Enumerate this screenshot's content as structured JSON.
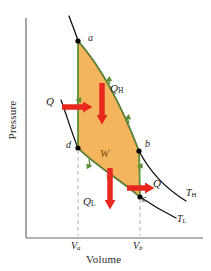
{
  "figure": {
    "type": "carnot-cycle-pv-diagram",
    "axes": {
      "x_title": "Volume",
      "y_title": "Pressure",
      "x_ticks": [
        {
          "id": "Va",
          "base": "V",
          "sub": "a",
          "x": 78
        },
        {
          "id": "Vb",
          "base": "V",
          "sub": "b",
          "x": 139
        }
      ]
    },
    "state_points": [
      {
        "id": "a",
        "label": "a",
        "x": 78,
        "y": 41
      },
      {
        "id": "b",
        "label": "b",
        "x": 139,
        "y": 151
      },
      {
        "id": "c",
        "label": "c",
        "x": 140,
        "y": 197
      },
      {
        "id": "d",
        "label": "d",
        "x": 78,
        "y": 148
      }
    ],
    "isotherms": [
      {
        "id": "T_H",
        "base": "T",
        "sub": "H"
      },
      {
        "id": "T_L",
        "base": "T",
        "sub": "L"
      }
    ],
    "heat_arrows": [
      {
        "id": "Q-in-left",
        "base": "Q",
        "sub": "",
        "direction": "right"
      },
      {
        "id": "Q-H",
        "base": "Q",
        "sub": "H",
        "direction": "down"
      },
      {
        "id": "Q-L",
        "base": "Q",
        "sub": "L",
        "direction": "down"
      },
      {
        "id": "Q-out-right",
        "base": "Q",
        "sub": "",
        "direction": "right"
      }
    ],
    "work_label": {
      "base": "W",
      "sub": ""
    },
    "colors": {
      "fill": "#f5b55e",
      "cycle_curve": "#5f8f3a",
      "isotherm": "#000000",
      "heat_arrow": "#e8281e",
      "axis": "#555555",
      "tick_dash": "#aaaaaa",
      "point": "#000000",
      "text": "#1a1a1a",
      "work_text": "#7a4a12"
    }
  }
}
